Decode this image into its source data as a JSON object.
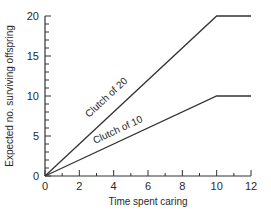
{
  "chart_data": {
    "type": "line",
    "title": "",
    "xlabel": "Time spent caring",
    "ylabel": "Expected no. surviving offspring",
    "xlim": [
      0,
      12
    ],
    "ylim": [
      0,
      20
    ],
    "x_ticks": [
      "0",
      "2",
      "4",
      "6",
      "8",
      "10",
      "12"
    ],
    "y_ticks": [
      "0",
      "5",
      "10",
      "15",
      "20"
    ],
    "grid": false,
    "legend": "inline labels on lines",
    "series": [
      {
        "name": "Clutch of 20",
        "x": [
          0,
          10,
          12
        ],
        "y": [
          0,
          20,
          20
        ]
      },
      {
        "name": "Clutch of 10",
        "x": [
          0,
          10,
          12
        ],
        "y": [
          0,
          10,
          10
        ]
      }
    ]
  }
}
